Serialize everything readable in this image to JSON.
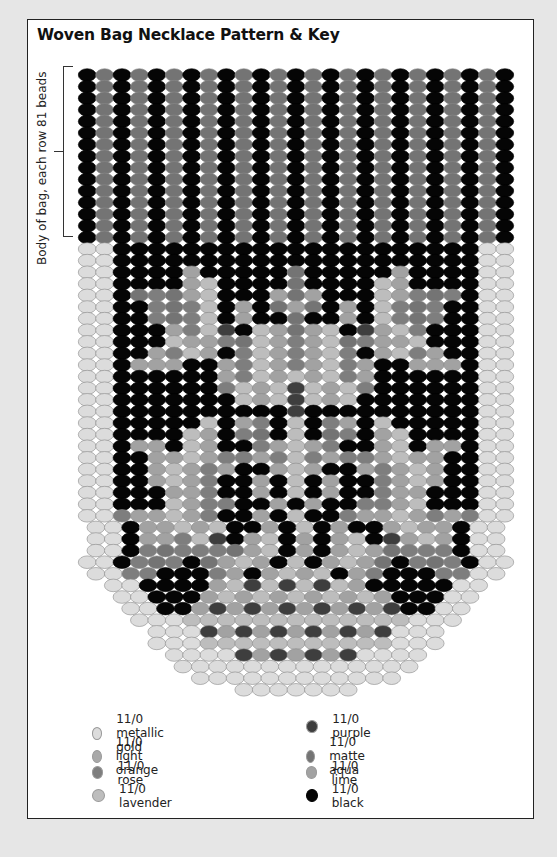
{
  "title": "Woven Bag Necklace Pattern & Key",
  "side_label": "Body of bag, each row 81 beads",
  "colors": {
    "G": "#dcdcdc",
    "O": "#a9a9a9",
    "R": "#7e7e7e",
    "L": "#bdbdbd",
    "P": "#3e3e3e",
    "A": "#747474",
    "M": "#a2a2a2",
    "K": "#050505"
  },
  "legend": [
    {
      "code": "G",
      "label": "11/0 metallic gold"
    },
    {
      "code": "O",
      "label": "11/0 light orange"
    },
    {
      "code": "R",
      "label": "11/0 rose"
    },
    {
      "code": "L",
      "label": "11/0 lavender"
    },
    {
      "code": "P",
      "label": "11/0 purple"
    },
    {
      "code": "A",
      "label": "11/0 matte aqua"
    },
    {
      "code": "M",
      "label": "11/0 lime"
    },
    {
      "code": "K",
      "label": "11/0 black"
    }
  ],
  "pattern": {
    "body_rows": 15,
    "body_row": "KAKAKAKAKAKAKAKAKAKAKAKAK",
    "rows": [
      "GGKKKKKKKKKKKKKKKKKKKKKGG",
      "GGKKKKKKKKKKKKKKKKKKKKKGG",
      "GGKKKKMKKKKKAKKKKKMKKKKGG",
      "GGKKKKMLKKKKAKKKKLMKKKKGG",
      "GGKARAMLKKKMAMKKKLMRARKGG",
      "GGKKRARLKMKAMAKMKLRARKKGG",
      "GGKKRARLKMKKAKKMKLRARKKGG",
      "GGKKKMRLPKLMAMLKPMLRKKKGG",
      "GGKKKLMMRALMRMLARMMLKKKGG",
      "GGKKMRLMKRLMRMLRKMLRMKKGG",
      "GGKMMMKKMRLMRMLRMKKMMMKGG",
      "GGKKKKKKMRLMLMLRMKKKKKKGG",
      "GGKKKKKKRLMLPLMLRKKKKKKGG",
      "GGKKKKKKKLMLPLMLKKKKKKKGG",
      "GGKKKKKKKKKKPKKKKKKKKKKGG",
      "GGKKKKKLKMRKLKRMKLKKKKKGG",
      "GGKKKKLMKRAKLKARKMLKKKKGG",
      "GGKMMKLMKKRMLMRKKMLKMMKGG",
      "GGKKMMLMRRMRLRMRRMLMMKKGG",
      "GGKKMLMRMKKMLMKKMRMLMKKGG",
      "GGKKMLMRKKMKLKMKKRMLMKKGG",
      "GGKKKMMRKKMKLKMKKRMMKKKGG",
      "GGKKKLMRRKKMKMKKRRMLKKKGG",
      "GGRMMLMRKKMKLKKRMMLMRMRGG",
      "GGKMMLMLKKMKLKMKKMLMMKGG",
      "GGKMMRLPKMLKMKMLKPMLMKGG",
      "GGKRARRRAMLKMKMLMARRRKGG",
      "GGKRARKAMLMKLKMLMAKRARKGG",
      "GGRRKKKRMKMLMLKMRKKKRRGG",
      "GGKKKKMLPLPLPLMKKKKKGG",
      "GGKKKMLMLMLMLMLMKKKGG",
      "GGKKMPMPMPMPMPMPKKGG",
      "GGGLLLLLLLLLLLLLGGG",
      "GGGPMPMPMPMPMPGGG",
      "GGGLLLLLLLLLLLGGG",
      "GGGGPMPMPMPGGGG",
      "GGGGGGGGGGGGGG",
      "GGGGGGGGGGGG",
      "GGGGGGG"
    ]
  }
}
